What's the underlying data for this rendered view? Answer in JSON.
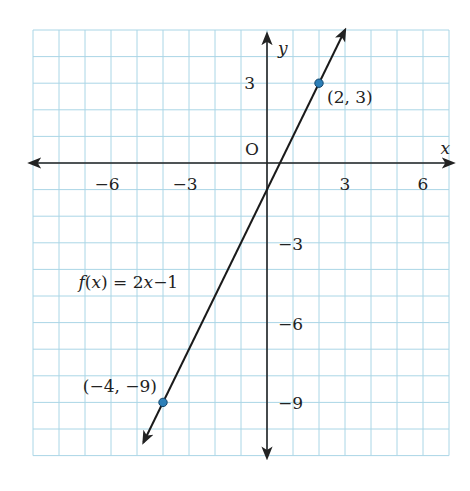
{
  "chart_data": {
    "type": "line",
    "title": "",
    "xlabel": "x",
    "ylabel": "y",
    "origin_label": "O",
    "xlim": [
      -9,
      7
    ],
    "ylim": [
      -11,
      5
    ],
    "grid": true,
    "grid_step": 1,
    "x_ticks": [
      {
        "value": -6,
        "label": "−6"
      },
      {
        "value": -3,
        "label": "−3"
      },
      {
        "value": 3,
        "label": "3"
      },
      {
        "value": 6,
        "label": "6"
      }
    ],
    "y_ticks": [
      {
        "value": 3,
        "label": "3"
      },
      {
        "value": -3,
        "label": "−3"
      },
      {
        "value": -6,
        "label": "−6"
      },
      {
        "value": -9,
        "label": "−9"
      }
    ],
    "series": [
      {
        "name": "f(x) = 2x−1",
        "slope": 2,
        "intercept": -1,
        "x_range": [
          -4.75,
          3.0
        ]
      }
    ],
    "points": [
      {
        "x": 2,
        "y": 3,
        "label": "(2, 3)"
      },
      {
        "x": -4,
        "y": -9,
        "label": "(−4, −9)"
      }
    ],
    "annotations": [
      {
        "text": "f(x) = 2x−1",
        "near": [
          -5.5,
          -4.5
        ]
      }
    ],
    "colors": {
      "grid": "#aad6e6",
      "axis": "#222222",
      "line": "#1a1a1a",
      "point_fill": "#2c7fb8",
      "point_stroke": "#15466b"
    }
  }
}
